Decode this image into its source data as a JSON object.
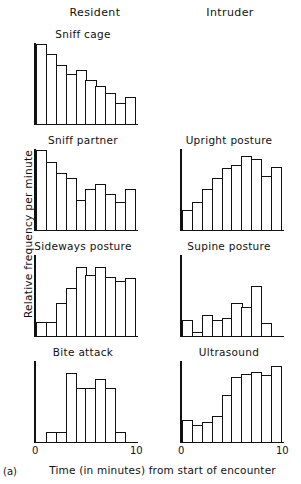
{
  "figure": {
    "tag": "(a)",
    "ylabel": "Relative frequency per minute",
    "xlabel": "Time (in minutes) from start of encounter"
  },
  "columns": [
    {
      "label": "Resident"
    },
    {
      "label": "Intruder"
    }
  ],
  "axis": {
    "x_tick_min": "0",
    "x_tick_max": "10"
  },
  "chart_data": {
    "type": "bar",
    "title": "",
    "xlabel": "Time (in minutes) from start of encounter",
    "ylabel": "Relative frequency per minute",
    "xlim": [
      0,
      10
    ],
    "ylim": [
      0,
      100
    ],
    "grid": false,
    "legend": null,
    "bin_width": 1,
    "categories": [
      "0-1",
      "1-2",
      "2-3",
      "3-4",
      "4-5",
      "5-6",
      "6-7",
      "7-8",
      "8-9",
      "9-10"
    ],
    "panels": [
      {
        "title": "Sniff cage",
        "column": "Resident",
        "row": 1,
        "values": [
          100,
          87,
          73,
          62,
          67,
          55,
          47,
          38,
          26,
          33
        ]
      },
      {
        "title": "Sniff partner",
        "column": "Resident",
        "row": 2,
        "values": [
          100,
          85,
          71,
          65,
          37,
          51,
          57,
          45,
          34,
          51
        ]
      },
      {
        "title": "Upright posture",
        "column": "Intruder",
        "row": 2,
        "values": [
          25,
          35,
          51,
          65,
          77,
          81,
          92,
          88,
          67,
          78
        ]
      },
      {
        "title": "Sideways posture",
        "column": "Resident",
        "row": 3,
        "values": [
          17,
          17,
          41,
          59,
          86,
          76,
          86,
          73,
          68,
          72
        ]
      },
      {
        "title": "Supine posture",
        "column": "Intruder",
        "row": 3,
        "values": [
          20,
          4,
          26,
          19,
          22,
          41,
          36,
          62,
          16,
          0
        ]
      },
      {
        "title": "Bite attack",
        "column": "Resident",
        "row": 4,
        "values": [
          0,
          12,
          12,
          86,
          67,
          67,
          78,
          67,
          12,
          0
        ]
      },
      {
        "title": "Ultrasound",
        "column": "Intruder",
        "row": 4,
        "values": [
          27,
          21,
          25,
          32,
          58,
          81,
          85,
          87,
          83,
          94
        ]
      }
    ]
  }
}
